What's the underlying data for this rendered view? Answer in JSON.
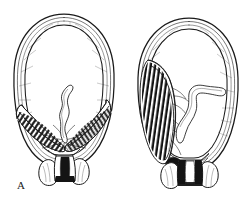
{
  "figure": {
    "background_color": "#ffffff",
    "ink_color": "#1a1a1a",
    "width": 250,
    "height": 207,
    "style": "pen-and-ink line engraving, black on white, no shading tones"
  },
  "panels": [
    {
      "id": "A",
      "label": "A",
      "label_position": {
        "x": 17,
        "y": 180
      },
      "caption_semantics": "central complete placenta previa",
      "description": "Sagittal section of gravid uterus. Pear/ovoid uterine outline drawn with multiple concentric contour lines. Placenta occupies the entire lower uterine segment, spanning the internal os completely, rendered as dense radial cotyledon hatching. Umbilical cord coils upward from the centre of the placental mass. Cervix below is a narrow dark canal flanked by vaginal fornices.",
      "outline": {
        "center_x": 64,
        "top_y": 14,
        "bottom_y": 162,
        "half_width": 50
      },
      "structures": [
        {
          "name": "uterine-wall",
          "shape": "ovoid-multiline",
          "contours": 4
        },
        {
          "name": "amniotic-cavity",
          "shape": "ovoid-interior",
          "fill": "white"
        },
        {
          "name": "placenta",
          "position": "lower-segment-complete",
          "hatching": "radial-cotyledon",
          "fill": "#1a1a1a"
        },
        {
          "name": "umbilical-cord",
          "path": "central-ascending-wavy",
          "fill": "white"
        },
        {
          "name": "cervix",
          "canal": "closed-dark"
        },
        {
          "name": "vaginal-fornix-left",
          "shape": "lobe"
        },
        {
          "name": "vaginal-fornix-right",
          "shape": "lobe"
        }
      ]
    },
    {
      "id": "B",
      "label": "B",
      "label_position": {
        "x": 139,
        "y": 178
      },
      "caption_semantics": "lateral marginal placenta previa",
      "description": "Sagittal section of gravid uterus. Placenta is implanted on the left lateral and lower wall, reaching but not covering the internal os; rendered as a tall band of dark cotyledon hatching. Umbilical cord emerges from the placental margin and curves to the right with a rounded blunt end. Cervical canal below is open and white, outlined in dark ink, flanked by vaginal fornices.",
      "outline": {
        "center_x": 64,
        "top_y": 18,
        "bottom_y": 166,
        "half_width": 50
      },
      "structures": [
        {
          "name": "uterine-wall",
          "shape": "ovoid-multiline",
          "contours": 4
        },
        {
          "name": "amniotic-cavity",
          "shape": "ovoid-interior",
          "fill": "white"
        },
        {
          "name": "placenta",
          "position": "left-lateral-marginal",
          "hatching": "radial-cotyledon",
          "fill": "#1a1a1a"
        },
        {
          "name": "umbilical-cord",
          "path": "right-curving-blunt-end",
          "fill": "white"
        },
        {
          "name": "cervix",
          "canal": "open-white"
        },
        {
          "name": "vaginal-fornix-left",
          "shape": "lobe"
        },
        {
          "name": "vaginal-fornix-right",
          "shape": "lobe"
        }
      ]
    }
  ]
}
